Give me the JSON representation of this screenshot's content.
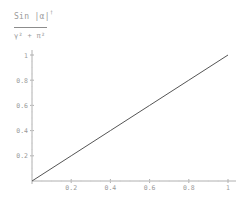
{
  "chart_data": {
    "type": "line",
    "title_parts": {
      "numerator": "Sin |α|",
      "numerator_sup": "†",
      "denominator": "γ² + π²"
    },
    "xlabel": "",
    "ylabel": "",
    "x": [
      0,
      1
    ],
    "series": [
      {
        "name": "line",
        "x": [
          0,
          0.2,
          0.4,
          0.6,
          0.8,
          1.0
        ],
        "values": [
          0,
          0.2,
          0.4,
          0.6,
          0.8,
          1.0
        ]
      }
    ],
    "xlim": [
      0,
      1
    ],
    "ylim": [
      0,
      1
    ],
    "x_ticks": [
      "0.2",
      "0.4",
      "0.6",
      "0.8",
      "1"
    ],
    "y_ticks": [
      "0.2",
      "0.4",
      "0.6",
      "0.8",
      "1"
    ],
    "grid": false,
    "legend": "none",
    "colors": {
      "line": "#555555",
      "axis": "#b0b0b0",
      "text": "#9a9a9a"
    }
  }
}
